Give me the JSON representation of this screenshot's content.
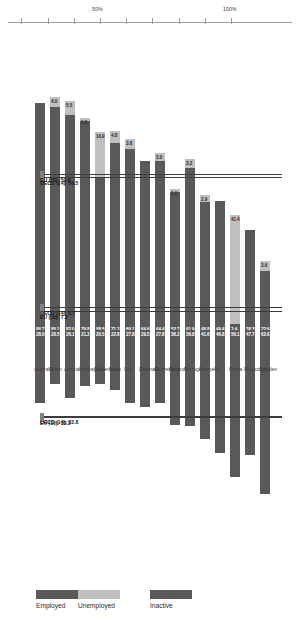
{
  "chart_data": {
    "type": "bar",
    "title": "",
    "subtitle": "",
    "xlabel": "",
    "ylabel": "",
    "ylim": [
      -60,
      100
    ],
    "grid": false,
    "legend_position": "bottom",
    "categories": [
      "Sweden",
      "Mexico (a)",
      "Korea",
      "UK",
      "France",
      "Portugal",
      "Belgium",
      "Switzerland",
      "Denmark",
      "US",
      "Italy",
      "Netherlands",
      "Norway (a)",
      "Austria",
      "Spain",
      "Australia"
    ],
    "series": [
      {
        "name": "Employed",
        "values": [
          22.6,
          38.3,
          2.4,
          49.4,
          48.8,
          61.9,
          52.7,
          64.4,
          64.6,
          69.1,
          71.2,
          58.5,
          79.8,
          82.0,
          85.1,
          86.7
        ]
      },
      {
        "name": "Unemployed",
        "values": [
          3.6,
          null,
          41.4,
          null,
          2.9,
          3.2,
          1.0,
          3.0,
          null,
          3.8,
          4.8,
          16.9,
          1.0,
          5.5,
          4.0,
          null
        ]
      },
      {
        "name": "Inactive",
        "values": [
          -62.6,
          -47.7,
          -56.1,
          -46.8,
          -41.6,
          -36.8,
          -36.2,
          -27.8,
          -29.5,
          -27.8,
          -22.8,
          -20.5,
          -21.2,
          -26.1,
          -20.5,
          -28.0
        ]
      }
    ],
    "employed_labels": [
      "22.6",
      "38.3",
      "2.4",
      "49.4",
      "48.8",
      "61.9",
      "52.7",
      "64.4",
      "64.6",
      "69.1",
      "71.2",
      "58.5",
      "79.8",
      "82.0",
      "85.1",
      "86.7"
    ],
    "unemployed_labels": [
      "3.6",
      "",
      "41.4",
      "",
      "2.9",
      "3.2",
      "1.0",
      "3.0",
      "",
      "3.8",
      "4.8",
      "16.9",
      "1.0",
      "5.5",
      "4.0",
      ""
    ],
    "inactive_labels": [
      "62.6",
      "47.7",
      "56.1",
      "46.8",
      "41.6",
      "36.8",
      "36.2",
      "27.8",
      "29.5",
      "27.8",
      "22.8",
      "20.5",
      "21.2",
      "26.1",
      "20.5",
      "28.0"
    ],
    "axis_ticks_top": [
      "100%",
      "50%",
      "10%",
      "0%"
    ],
    "axis_ticks_bottom": [
      "10%",
      "50%"
    ],
    "annotations": [
      {
        "id": "oecd-employed",
        "text": "OECD (14): 58.5"
      },
      {
        "id": "eu-employed",
        "text": "EU (10): 59.6"
      },
      {
        "id": "eu-unemployed",
        "text": "EU (10): 7.2"
      },
      {
        "id": "oecd-unemployed",
        "text": "OECD (14): 8.7"
      },
      {
        "id": "oecd-inactive",
        "text": "OECD (14): 32.8"
      },
      {
        "id": "eu-inactive",
        "text": "EU (10): 33.2"
      }
    ],
    "colors": {
      "employed": "#595959",
      "unemployed": "#bfbfbf",
      "inactive": "#595959",
      "axis": "#9aa0a6",
      "average_line": "#3c3c3c"
    }
  },
  "legend": {
    "items": [
      {
        "label": "Employed",
        "color": "#595959"
      },
      {
        "label": "Unemployed",
        "color": "#bfbfbf"
      },
      {
        "label": "Inactive",
        "color": "#595959"
      }
    ]
  },
  "axis": {
    "ticks": [
      {
        "label": "100%"
      },
      {
        "label": "50%"
      },
      {
        "label": "10%"
      },
      {
        "label": "0%"
      },
      {
        "label": "10%"
      },
      {
        "label": "50%"
      }
    ]
  }
}
